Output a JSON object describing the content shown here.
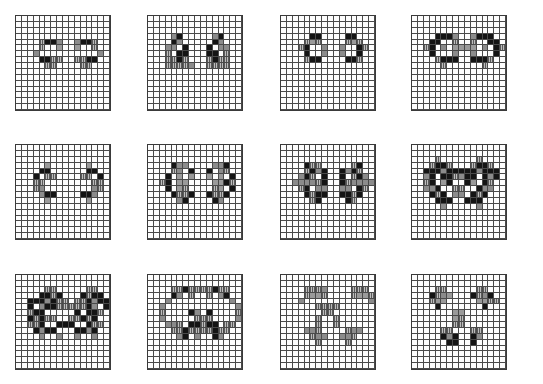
{
  "figure": {
    "legend": {
      ".": "empty",
      "#": "black",
      "h": "hatched",
      "s": "stippled",
      "g": "gray"
    },
    "panels": [
      {
        "id": "panel-1",
        "rows": [
          "................",
          "................",
          "................",
          "................",
          "....h##s..s##h..",
          "....h..g..g..h..",
          "...s..........s.",
          "....##hh..hh##..",
          ".....hh....hh...",
          "................",
          "................",
          "................",
          "................",
          "................",
          "................",
          "................"
        ]
      },
      {
        "id": "panel-2",
        "rows": [
          "................",
          "................",
          "................",
          "....s#.....s#...",
          "....#s.....#s...",
          "...ss.#...#.ss..",
          "...h.##...##.h..",
          "...hh#h...h#hh..",
          "...hhhhs..hhhh..",
          "................",
          "................",
          "................",
          "................",
          "................",
          "................",
          "................"
        ]
      },
      {
        "id": "panel-3",
        "rows": [
          "................",
          "................",
          "................",
          ".....##....##...",
          "....hgh....hgh..",
          "...h#..s..s..#h.",
          "....#..s..s..#..",
          "....h##....##h..",
          "................",
          "................",
          "................",
          "................",
          "................",
          "................",
          "................",
          "................"
        ]
      },
      {
        "id": "panel-4",
        "rows": [
          "................",
          "................",
          "................",
          "....###s..s###..",
          "...##..h..h..##.",
          "..h#.s.gggg.s.#h",
          "...#...s..s...#.",
          "....h###..###h..",
          ".....h......h...",
          "................",
          "................",
          "................",
          "................",
          "................",
          "................",
          "................"
        ]
      },
      {
        "id": "panel-5",
        "rows": [
          "................",
          "................",
          "................",
          ".....g......g...",
          "....##......##..",
          "...#.hh....hh.#.",
          "...hh........hh.",
          "...hs........sh.",
          "....s##....##s..",
          ".....g......g...",
          "................",
          "................",
          "................",
          "................",
          "................",
          "................"
        ]
      },
      {
        "id": "panel-6",
        "rows": [
          "................",
          "................",
          "................",
          "....#ss....ss#..",
          "....hs.#..#.sh..",
          "...#.g.g..g.g.#.",
          "..h#.gg....gg#h.",
          "...#.gh....hg.#.",
          "....#hh#..#hh#..",
          ".....s#....#s...",
          "................",
          "................",
          "................",
          "................",
          "................",
          "................"
        ]
      },
      {
        "id": "panel-7",
        "rows": [
          "................",
          "................",
          "................",
          "....#hh.....h#..",
          "....h#s#..#s#h..",
          "...s#h.#..#.h#s.",
          "..ssssh#..#hssss",
          "...h#.ss..ss.#h.",
          "....#h##..##h#..",
          ".....h#....#h...",
          "................",
          "................",
          "................",
          "................",
          "................",
          "................"
        ]
      },
      {
        "id": "panel-8",
        "rows": [
          "................",
          "................",
          "....h......h....",
          "...h##h...h##h..",
          "..###s#####s###.",
          "..s#.##hs##.#s#.",
          "..h#.g#..#g.#h..",
          "..ss#..hh..#ss..",
          "...#h#.ss.#h#...",
          "....###..###....",
          ".....s.....s....",
          "................",
          "................",
          "................",
          "................",
          "................"
        ]
      },
      {
        "id": "panel-9",
        "rows": [
          "................",
          "................",
          ".....hh.....hh..",
          "....##h#...#h##.",
          "..###s#hh.hh#s###",
          "..#.s##hhhhh#s.#.",
          "..h##.....#.##h..",
          "..#h#hh..hh#h#...",
          "..hh#..###..#hh..",
          "...#s##...##s#...",
          "....s..s..s..s...",
          "................",
          "................",
          "................",
          "................",
          "................"
        ]
      },
      {
        "id": "panel-10",
        "rows": [
          "................",
          "................",
          "....hh#hhhh#hh..",
          "....#s.h..h.s#..",
          "...s..........s.",
          "..s............s",
          "..h....#s.#....h",
          "..s.....hhh....s",
          "...ssh.##h##.hh.",
          "....hh#hhhh#hh..",
          ".....s#.s..#s...",
          "................",
          "................",
          "................",
          "................",
          "................"
        ]
      },
      {
        "id": "panel-11",
        "rows": [
          "................",
          "................",
          "....hhhs....hhh.",
          "....hggh....hggh",
          "...s...........s",
          "......hhhh......",
          ".......hh.......",
          "......h..h......",
          "......h..h......",
          "....ssh....hss..",
          ".....hss..ssh...",
          "......h....h....",
          "................",
          "................",
          "................",
          "................"
        ]
      },
      {
        "id": "panel-12",
        "rows": [
          "................",
          "................",
          "....hh.....hh...",
          "...#hsg...#hs#..",
          "...hgg.....gghh.",
          "....#.......#...",
          ".......gg.......",
          ".......gh.......",
          ".......hh.......",
          ".....hh...hh....",
          ".....#s#..#s....",
          "......##..#.....",
          "................",
          "................",
          "................",
          "................"
        ]
      }
    ]
  }
}
